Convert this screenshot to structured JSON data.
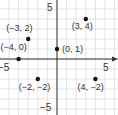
{
  "chart_data": {
    "type": "scatter",
    "title": "",
    "xlabel": "",
    "ylabel": "",
    "xlim": [
      -6,
      6
    ],
    "ylim": [
      -6,
      6
    ],
    "grid": true,
    "tick_labels": {
      "x_neg": "−5",
      "x_pos": "5",
      "y_pos": "5",
      "y_neg": "−5"
    },
    "points": [
      {
        "x": -3,
        "y": 2,
        "label": "(−3, 2)"
      },
      {
        "x": 3,
        "y": 4,
        "label": "(3, 4)"
      },
      {
        "x": -4,
        "y": 0,
        "label": "(−4, 0)"
      },
      {
        "x": 0,
        "y": 1,
        "label": "(0, 1)"
      },
      {
        "x": -2,
        "y": -2,
        "label": "(−2, −2)"
      },
      {
        "x": 4,
        "y": -2,
        "label": "(4, −2)"
      }
    ],
    "colors": {
      "point": "#111111",
      "axis": "#333333",
      "grid": "#e3e3e3"
    }
  }
}
